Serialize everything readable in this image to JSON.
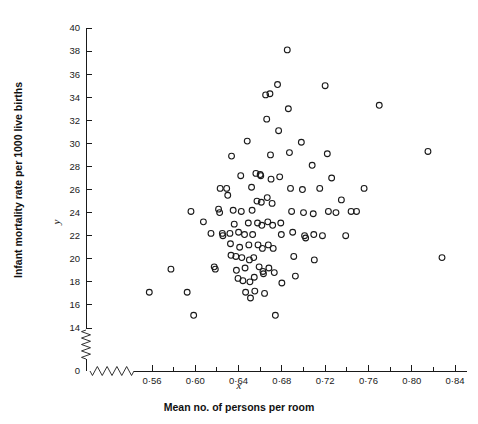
{
  "figure": {
    "background_color": "#ffffff",
    "ink_color": "#1a1a1a",
    "width": 478,
    "height": 424
  },
  "labels": {
    "y_axis_title": "Infant mortality rate per 1000 live births",
    "y_axis_variable": "y",
    "x_axis_title": "Mean no. of persons per room",
    "x_axis_variable": "x",
    "y_zero_label": "0"
  },
  "chart_data": {
    "type": "scatter",
    "title": "",
    "xlabel": "Mean no. of persons per room",
    "ylabel": "Infant mortality rate per 1000 live births",
    "x_symbol": "x",
    "y_symbol": "y",
    "xlim": [
      0.54,
      0.845
    ],
    "ylim": [
      13.2,
      40.4
    ],
    "grid": false,
    "legend": null,
    "axis_break_x": true,
    "axis_break_y": true,
    "marker": "open-circle",
    "xticks": [
      0.56,
      0.6,
      0.64,
      0.68,
      0.72,
      0.76,
      0.8,
      0.84
    ],
    "xtick_labels": [
      "0·56",
      "0·60",
      "0·64",
      "0·68",
      "0·72",
      "0·76",
      "0·80",
      "0·84"
    ],
    "x_minor_ticks": [
      0.58,
      0.62,
      0.66,
      0.7,
      0.74,
      0.78,
      0.82
    ],
    "yticks": [
      14,
      16,
      18,
      20,
      22,
      24,
      26,
      28,
      30,
      32,
      34,
      36,
      38,
      40
    ],
    "ytick_labels": [
      "14",
      "16",
      "18",
      "20",
      "22",
      "24",
      "26",
      "28",
      "30",
      "32",
      "34",
      "36",
      "38",
      "40"
    ],
    "n_points": 112,
    "points": [
      [
        0.5575,
        17.1
      ],
      [
        0.5775,
        19.1
      ],
      [
        0.5925,
        17.1
      ],
      [
        0.596,
        24.1
      ],
      [
        0.5985,
        15.1
      ],
      [
        0.6075,
        23.2
      ],
      [
        0.6145,
        22.2
      ],
      [
        0.6175,
        19.3
      ],
      [
        0.6185,
        19.1
      ],
      [
        0.6215,
        24.3
      ],
      [
        0.6225,
        24.0
      ],
      [
        0.623,
        26.1
      ],
      [
        0.625,
        22.2
      ],
      [
        0.6255,
        22.0
      ],
      [
        0.629,
        26.1
      ],
      [
        0.63,
        25.5
      ],
      [
        0.632,
        22.2
      ],
      [
        0.6325,
        21.3
      ],
      [
        0.633,
        20.3
      ],
      [
        0.6335,
        28.9
      ],
      [
        0.635,
        24.2
      ],
      [
        0.636,
        23.0
      ],
      [
        0.6375,
        20.2
      ],
      [
        0.638,
        19.0
      ],
      [
        0.6395,
        18.3
      ],
      [
        0.64,
        22.3
      ],
      [
        0.641,
        21.0
      ],
      [
        0.642,
        27.2
      ],
      [
        0.6425,
        24.1
      ],
      [
        0.643,
        20.1
      ],
      [
        0.644,
        18.1
      ],
      [
        0.6455,
        22.1
      ],
      [
        0.646,
        19.2
      ],
      [
        0.6465,
        17.1
      ],
      [
        0.648,
        30.2
      ],
      [
        0.649,
        23.1
      ],
      [
        0.6495,
        21.2
      ],
      [
        0.65,
        19.9
      ],
      [
        0.6505,
        18.0
      ],
      [
        0.651,
        16.6
      ],
      [
        0.652,
        26.2
      ],
      [
        0.6525,
        24.2
      ],
      [
        0.653,
        22.1
      ],
      [
        0.654,
        20.1
      ],
      [
        0.6545,
        18.4
      ],
      [
        0.655,
        17.2
      ],
      [
        0.656,
        27.4
      ],
      [
        0.657,
        25.0
      ],
      [
        0.6575,
        23.1
      ],
      [
        0.658,
        21.2
      ],
      [
        0.659,
        19.3
      ],
      [
        0.66,
        27.3
      ],
      [
        0.6605,
        27.2
      ],
      [
        0.661,
        24.9
      ],
      [
        0.6615,
        22.9
      ],
      [
        0.662,
        20.9
      ],
      [
        0.6625,
        18.9
      ],
      [
        0.663,
        18.7
      ],
      [
        0.664,
        17.0
      ],
      [
        0.665,
        34.2
      ],
      [
        0.666,
        32.1
      ],
      [
        0.6665,
        25.3
      ],
      [
        0.667,
        23.2
      ],
      [
        0.6675,
        21.2
      ],
      [
        0.668,
        19.2
      ],
      [
        0.669,
        34.3
      ],
      [
        0.6695,
        29.0
      ],
      [
        0.67,
        26.9
      ],
      [
        0.671,
        24.8
      ],
      [
        0.6715,
        22.9
      ],
      [
        0.672,
        20.9
      ],
      [
        0.673,
        18.8
      ],
      [
        0.674,
        15.1
      ],
      [
        0.676,
        35.1
      ],
      [
        0.677,
        31.1
      ],
      [
        0.678,
        27.1
      ],
      [
        0.679,
        23.1
      ],
      [
        0.6795,
        22.1
      ],
      [
        0.68,
        17.9
      ],
      [
        0.685,
        38.1
      ],
      [
        0.686,
        33.0
      ],
      [
        0.687,
        29.2
      ],
      [
        0.688,
        26.1
      ],
      [
        0.689,
        24.1
      ],
      [
        0.69,
        22.3
      ],
      [
        0.691,
        20.2
      ],
      [
        0.6925,
        18.5
      ],
      [
        0.698,
        30.1
      ],
      [
        0.699,
        26.0
      ],
      [
        0.7,
        24.0
      ],
      [
        0.701,
        22.0
      ],
      [
        0.702,
        21.8
      ],
      [
        0.708,
        28.1
      ],
      [
        0.709,
        23.9
      ],
      [
        0.7095,
        22.1
      ],
      [
        0.71,
        19.9
      ],
      [
        0.715,
        26.1
      ],
      [
        0.7175,
        22.0
      ],
      [
        0.72,
        35.0
      ],
      [
        0.722,
        29.1
      ],
      [
        0.723,
        24.1
      ],
      [
        0.726,
        27.0
      ],
      [
        0.73,
        24.0
      ],
      [
        0.735,
        25.1
      ],
      [
        0.739,
        22.0
      ],
      [
        0.744,
        24.1
      ],
      [
        0.749,
        24.1
      ],
      [
        0.756,
        26.1
      ],
      [
        0.77,
        33.3
      ],
      [
        0.815,
        29.3
      ],
      [
        0.828,
        20.1
      ]
    ]
  }
}
